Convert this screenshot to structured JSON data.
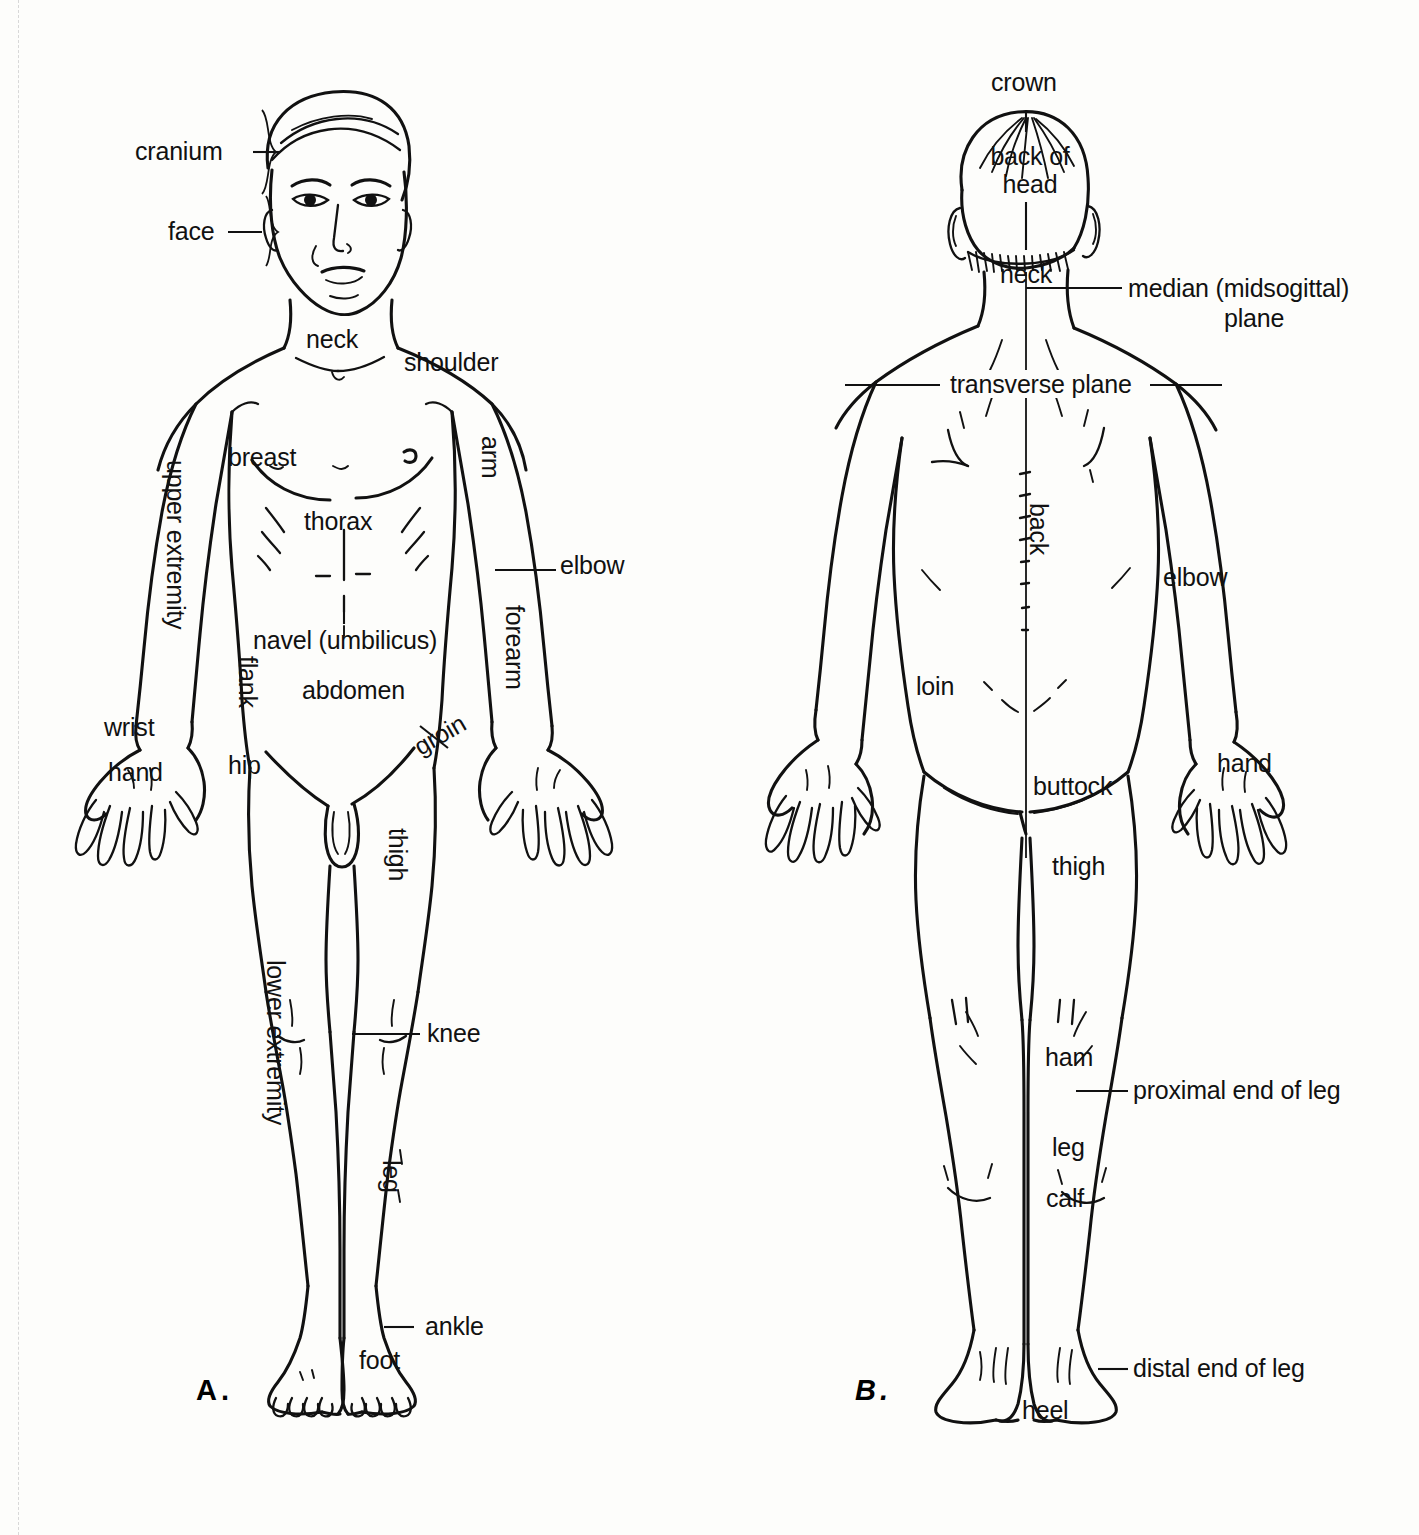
{
  "figure": {
    "type": "anatomical-surface-regions-diagram",
    "panels": [
      {
        "id": "A",
        "caption": "A.",
        "view": "anterior",
        "labels": [
          {
            "name": "cranium",
            "text": "cranium",
            "leader": "bracket"
          },
          {
            "name": "face",
            "text": "face",
            "leader": "bracket"
          },
          {
            "name": "neck",
            "text": "neck",
            "leader": "none"
          },
          {
            "name": "shoulder",
            "text": "shoulder",
            "leader": "none"
          },
          {
            "name": "breast",
            "text": "breast",
            "leader": "none"
          },
          {
            "name": "thorax",
            "text": "thorax",
            "leader": "none"
          },
          {
            "name": "arm",
            "text": "arm",
            "leader": "none",
            "rotated": true
          },
          {
            "name": "elbow",
            "text": "elbow",
            "leader": "line"
          },
          {
            "name": "forearm",
            "text": "forearm",
            "leader": "none",
            "rotated": true
          },
          {
            "name": "upper-extremity",
            "text": "upper extremity",
            "leader": "none",
            "rotated": true
          },
          {
            "name": "navel",
            "text": "navel (umbilicus)",
            "leader": "line"
          },
          {
            "name": "flank",
            "text": "flank",
            "leader": "none",
            "rotated": true
          },
          {
            "name": "abdomen",
            "text": "abdomen",
            "leader": "none"
          },
          {
            "name": "groin",
            "text": "groin",
            "leader": "line"
          },
          {
            "name": "hip",
            "text": "hip",
            "leader": "none"
          },
          {
            "name": "wrist",
            "text": "wrist",
            "leader": "none"
          },
          {
            "name": "hand",
            "text": "hand",
            "leader": "none"
          },
          {
            "name": "thigh",
            "text": "thigh",
            "leader": "none",
            "rotated": true
          },
          {
            "name": "lower-extremity",
            "text": "lower extremity",
            "leader": "none",
            "rotated": true
          },
          {
            "name": "knee",
            "text": "knee",
            "leader": "line"
          },
          {
            "name": "leg",
            "text": "leg",
            "leader": "none",
            "rotated": true
          },
          {
            "name": "ankle",
            "text": "ankle",
            "leader": "line"
          },
          {
            "name": "foot",
            "text": "foot",
            "leader": "none"
          }
        ]
      },
      {
        "id": "B",
        "caption": "B.",
        "view": "posterior",
        "labels": [
          {
            "name": "crown",
            "text": "crown",
            "leader": "line"
          },
          {
            "name": "back-of-head",
            "text": "back of\nhead",
            "line1": "back of",
            "line2": "head",
            "leader": "line"
          },
          {
            "name": "neck",
            "text": "neck",
            "leader": "none"
          },
          {
            "name": "median-plane",
            "text": "median (midsogittal)\nplane",
            "line1": "median (midsogittal)",
            "line2": "plane",
            "leader": "line"
          },
          {
            "name": "transverse-plane",
            "text": "transverse plane",
            "leader": "line"
          },
          {
            "name": "back",
            "text": "back",
            "leader": "none",
            "rotated": true
          },
          {
            "name": "elbow",
            "text": "elbow",
            "leader": "none"
          },
          {
            "name": "loin",
            "text": "loin",
            "leader": "none"
          },
          {
            "name": "hand",
            "text": "hand",
            "leader": "none"
          },
          {
            "name": "buttock",
            "text": "buttock",
            "leader": "none"
          },
          {
            "name": "thigh",
            "text": "thigh",
            "leader": "none"
          },
          {
            "name": "ham",
            "text": "ham",
            "leader": "none"
          },
          {
            "name": "proximal-end-of-leg",
            "text": "proximal end of leg",
            "leader": "line"
          },
          {
            "name": "leg",
            "text": "leg",
            "leader": "none"
          },
          {
            "name": "calf",
            "text": "calf",
            "leader": "none"
          },
          {
            "name": "distal-end-of-leg",
            "text": "distal end of leg",
            "leader": "line"
          },
          {
            "name": "heel",
            "text": "heel",
            "leader": "none"
          }
        ]
      }
    ],
    "colors": {
      "ink": "#111111",
      "paper": "#fdfdfb",
      "cut_line": "#d8d8d8"
    }
  }
}
